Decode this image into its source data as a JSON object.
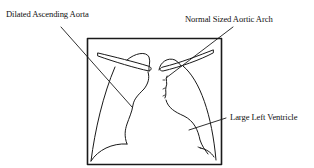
{
  "diagram": {
    "labels": {
      "ascending_aorta": "Dilated Ascending Aorta",
      "aortic_arch": "Normal Sized Aortic Arch",
      "left_ventricle": "Large Left Ventricle"
    },
    "colors": {
      "line": "#1a1a1a",
      "background": "#ffffff",
      "text": "#111111"
    }
  }
}
